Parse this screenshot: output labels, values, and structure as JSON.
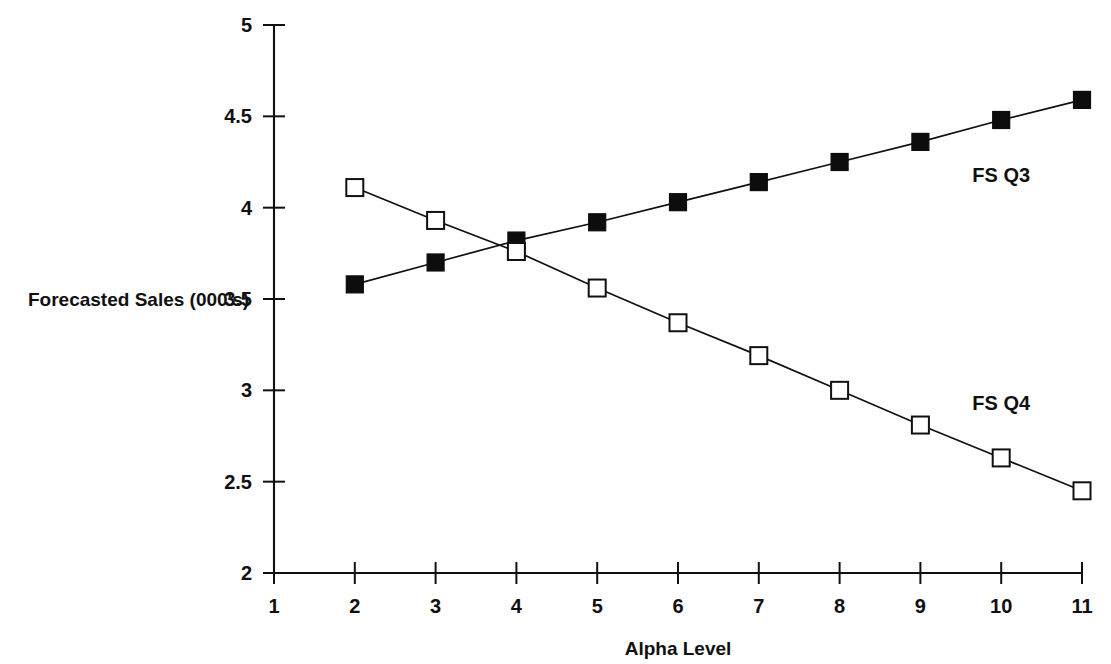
{
  "chart_data": {
    "type": "line",
    "title": "",
    "xlabel": "Alpha Level",
    "ylabel": "Forecasted Sales (000's)",
    "x": [
      2,
      3,
      4,
      5,
      6,
      7,
      8,
      9,
      10,
      11
    ],
    "xlim": [
      1,
      11
    ],
    "ylim": [
      2,
      5
    ],
    "xticks": [
      "1",
      "2",
      "3",
      "4",
      "5",
      "6",
      "7",
      "8",
      "9",
      "10",
      "11"
    ],
    "xtick_values": [
      1,
      2,
      3,
      4,
      5,
      6,
      7,
      8,
      9,
      10,
      11
    ],
    "yticks": [
      "2",
      "2.5",
      "3",
      "3.5",
      "4",
      "4.5",
      "5"
    ],
    "ytick_values": [
      2,
      2.5,
      3,
      3.5,
      4,
      4.5,
      5
    ],
    "grid": false,
    "legend_position": "inline-right",
    "series": [
      {
        "name": "FS Q3",
        "marker": "filled-square",
        "color": "#101010",
        "label_x": 10.0,
        "label_y": 4.18,
        "values": [
          3.58,
          3.7,
          3.82,
          3.92,
          4.03,
          4.14,
          4.25,
          4.36,
          4.48,
          4.59
        ]
      },
      {
        "name": "FS Q4",
        "marker": "open-square",
        "color": "#101010",
        "label_x": 10.0,
        "label_y": 2.93,
        "values": [
          4.11,
          3.93,
          3.76,
          3.56,
          3.37,
          3.19,
          3.0,
          2.81,
          2.63,
          2.45
        ]
      }
    ]
  },
  "colors": {
    "axis": "#101010",
    "background": "#ffffff",
    "series_q3": "#101010",
    "series_q4": "#101010"
  }
}
